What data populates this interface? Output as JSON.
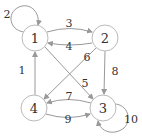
{
  "diagram": {
    "type": "directed-graph",
    "nodes": [
      {
        "id": "1",
        "label": "1",
        "x": 35,
        "y": 38
      },
      {
        "id": "2",
        "label": "2",
        "x": 105,
        "y": 38
      },
      {
        "id": "3",
        "label": "3",
        "x": 103,
        "y": 108
      },
      {
        "id": "4",
        "label": "4",
        "x": 34,
        "y": 108
      }
    ],
    "edges": [
      {
        "from": "4",
        "to": "1",
        "label": "1"
      },
      {
        "from": "1",
        "to": "1",
        "label": "2"
      },
      {
        "from": "1",
        "to": "2",
        "label": "3"
      },
      {
        "from": "2",
        "to": "1",
        "label": "4"
      },
      {
        "from": "1",
        "to": "3",
        "label": "5"
      },
      {
        "from": "2",
        "to": "4",
        "label": "6"
      },
      {
        "from": "3",
        "to": "4",
        "label": "7"
      },
      {
        "from": "2",
        "to": "3",
        "label": "8"
      },
      {
        "from": "4",
        "to": "3",
        "label": "9"
      },
      {
        "from": "3",
        "to": "3",
        "label": "10"
      }
    ]
  }
}
